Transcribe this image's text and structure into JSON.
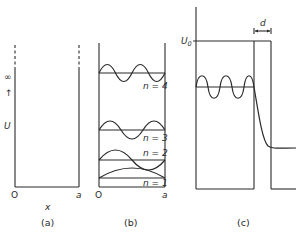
{
  "figure": {
    "panels": [
      {
        "id": "a",
        "caption": "(a)",
        "origin_label": "O",
        "width_label": "a",
        "x_axis_label": "x",
        "y_axis_label": "U",
        "infinity_label": "∞",
        "arrow_glyph": "↑"
      },
      {
        "id": "b",
        "caption": "(b)",
        "origin_label": "O",
        "width_label": "a",
        "levels": [
          {
            "n": 1,
            "label": "n = 1"
          },
          {
            "n": 2,
            "label": "n = 2"
          },
          {
            "n": 3,
            "label": "n = 3"
          },
          {
            "n": 4,
            "label": "n = 4"
          }
        ]
      },
      {
        "id": "c",
        "caption": "(c)",
        "barrier_height_label": "U",
        "barrier_height_subscript": "0",
        "barrier_width_label": "d"
      }
    ]
  }
}
